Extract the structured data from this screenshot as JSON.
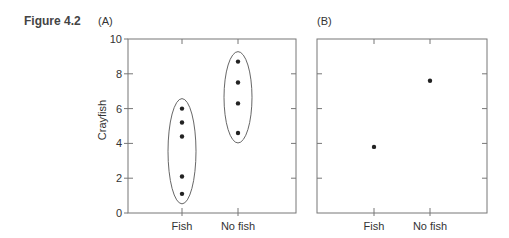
{
  "figure_label": "Figure 4.2",
  "chart_data": [
    {
      "type": "scatter",
      "panel_label": "(A)",
      "title": "",
      "xlabel": "",
      "ylabel": "Crayfish",
      "categories": [
        "Fish",
        "No fish"
      ],
      "ylim": [
        0,
        10
      ],
      "yticks": [
        0,
        2,
        4,
        6,
        8,
        10
      ],
      "ytick_labels": [
        "0",
        "2",
        "4",
        "6",
        "8",
        "10"
      ],
      "grid": false,
      "series": [
        {
          "name": "Fish",
          "values": [
            6.0,
            5.2,
            4.4,
            2.1,
            1.1
          ]
        },
        {
          "name": "No fish",
          "values": [
            8.7,
            7.5,
            6.3,
            4.6
          ]
        }
      ],
      "annotations": [
        "Ellipse encloses each group's points"
      ]
    },
    {
      "type": "scatter",
      "panel_label": "(B)",
      "title": "",
      "xlabel": "",
      "ylabel": "",
      "categories": [
        "Fish",
        "No fish"
      ],
      "ylim": [
        0,
        10
      ],
      "yticks": [
        0,
        2,
        4,
        6,
        8,
        10
      ],
      "ytick_labels": [],
      "grid": false,
      "series": [
        {
          "name": "Group value",
          "values": [
            3.8,
            7.6
          ]
        }
      ]
    }
  ]
}
